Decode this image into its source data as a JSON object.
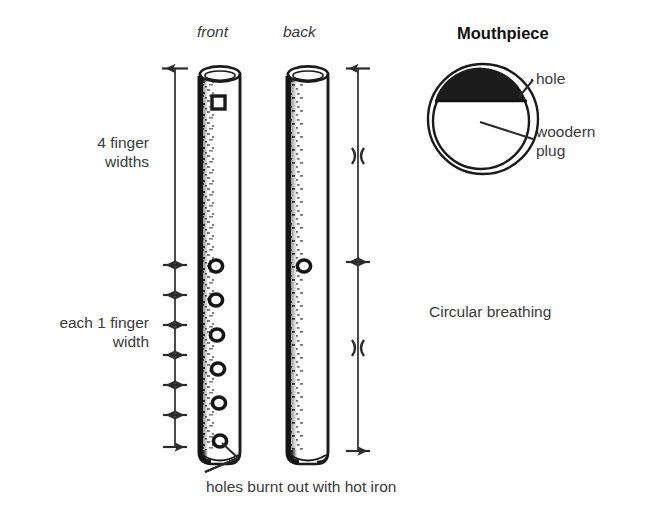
{
  "figure": {
    "title_mouthpiece": "Mouthpiece",
    "view_labels": {
      "front": "front",
      "back": "back"
    },
    "dimension_labels": {
      "four_finger_widths": "4 finger\nwidths",
      "each_one_finger_width": "each 1 finger\nwidth"
    },
    "callouts": {
      "hole": "hole",
      "wooden_plug": "woodern\nplug",
      "holes_burnt": "holes burnt out with hot iron"
    },
    "technique_note": "Circular breathing",
    "colors": {
      "ink": "#1a1a1a",
      "text": "#3a3a3a",
      "paper": "#ffffff",
      "hole_fill": "#1c1c1c"
    }
  },
  "diagram_data": {
    "type": "technical-illustration",
    "subject": "bamboo flute construction diagram",
    "instrument_views": [
      {
        "name": "front",
        "holes": 6,
        "mouth_hole_shape": "square",
        "mouth_hole_position": "near top"
      },
      {
        "name": "back",
        "holes": 1,
        "mouth_hole_shape": "none",
        "hole_position": "upper third (thumb hole)"
      }
    ],
    "measurements": {
      "upper_section": {
        "label": "4 finger widths",
        "value": 4,
        "unit": "finger widths"
      },
      "hole_spacing": {
        "label": "each 1 finger width",
        "value": 1,
        "unit": "finger width",
        "segments": 6
      },
      "right_scale_segments": 2
    },
    "mouthpiece_cross_section": {
      "outer_ring": true,
      "inner_ring": true,
      "filled_segment": "top crescent = hole",
      "center": "wooden plug"
    }
  }
}
